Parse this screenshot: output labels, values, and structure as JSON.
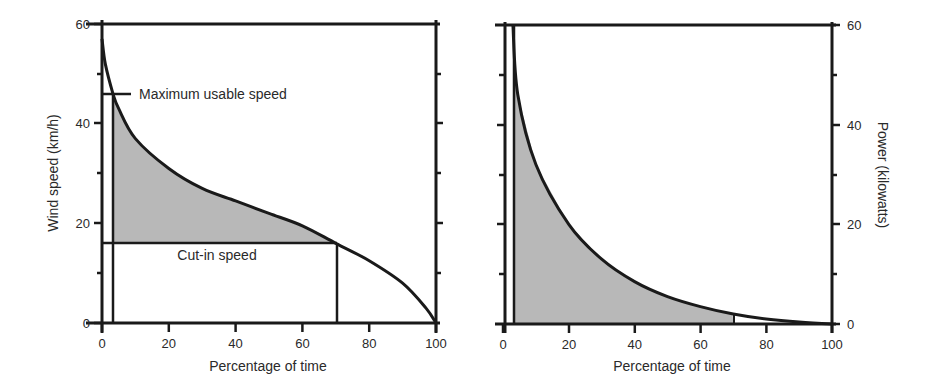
{
  "chart_data": [
    {
      "type": "area",
      "title": "",
      "xlabel": "Percentage of time",
      "ylabel": "Wind speed (km/h)",
      "xlim": [
        0,
        100
      ],
      "ylim": [
        0,
        60
      ],
      "xticks": [
        0,
        20,
        40,
        60,
        80,
        100
      ],
      "yticks": [
        0,
        20,
        40,
        60
      ],
      "grid": false,
      "series": [
        {
          "name": "Wind speed duration curve",
          "x": [
            0,
            1,
            3.3,
            5,
            10,
            20,
            30,
            40,
            50,
            60,
            70,
            80,
            90,
            97,
            100
          ],
          "values": [
            57,
            52,
            46,
            43,
            37,
            31,
            27,
            24.5,
            22,
            19.5,
            16,
            12.5,
            8,
            3,
            0
          ]
        }
      ],
      "shaded_region": {
        "x_start": 3.3,
        "x_end": 70,
        "y_floor": 16
      },
      "annotations": [
        {
          "text": "Maximum usable speed",
          "y": 46
        },
        {
          "text": "Cut-in speed",
          "y": 16
        }
      ],
      "reference_lines": {
        "max_usable_speed": 46,
        "cut_in_speed": 16,
        "x_left": 3.3,
        "x_right": 70
      }
    },
    {
      "type": "area",
      "title": "",
      "xlabel": "Percentage of time",
      "ylabel": "Power (kilowatts)",
      "xlim": [
        0,
        100
      ],
      "ylim": [
        0,
        60
      ],
      "xticks": [
        0,
        20,
        40,
        60,
        80,
        100
      ],
      "yticks": [
        0,
        20,
        40,
        60
      ],
      "yaxis_position": "right",
      "grid": false,
      "series": [
        {
          "name": "Power duration curve",
          "x": [
            3,
            4.5,
            10,
            20,
            30,
            40,
            50,
            60,
            70,
            80,
            90,
            100
          ],
          "values": [
            60,
            46,
            32,
            20,
            13,
            8.5,
            5.5,
            3.5,
            2,
            1,
            0.4,
            0
          ]
        }
      ],
      "shaded_region": {
        "x_start": 3.3,
        "x_end": 70,
        "y_floor": 0
      }
    }
  ],
  "left": {
    "ylabel": "Wind speed (km/h)",
    "xlabel": "Percentage of time",
    "yticks": [
      "0",
      "20",
      "40",
      "60"
    ],
    "xticks": [
      "0",
      "20",
      "40",
      "60",
      "80",
      "100"
    ],
    "annot_max": "Maximum usable speed",
    "annot_cutin": "Cut-in speed"
  },
  "right": {
    "ylabel": "Power (kilowatts)",
    "xlabel": "Percentage of time",
    "yticks": [
      "0",
      "20",
      "40",
      "60"
    ],
    "xticks": [
      "0",
      "20",
      "40",
      "60",
      "80",
      "100"
    ]
  },
  "colors": {
    "line": "#1a1a1a",
    "fill": "#b8b8b8",
    "background": "#ffffff"
  }
}
